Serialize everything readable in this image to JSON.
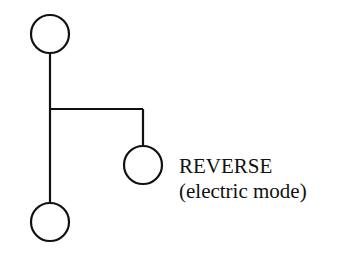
{
  "diagram": {
    "type": "gear-shift-pattern",
    "positions": [
      {
        "id": "top",
        "label": ""
      },
      {
        "id": "reverse",
        "label": "REVERSE",
        "sublabel": "(electric mode)"
      },
      {
        "id": "bottom",
        "label": ""
      }
    ],
    "stroke_color": "#111111",
    "background": "#ffffff"
  }
}
